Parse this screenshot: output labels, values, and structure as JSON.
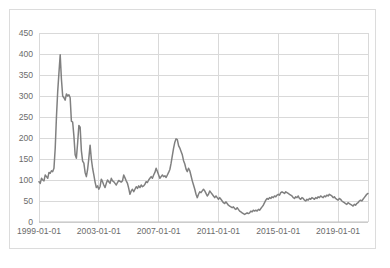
{
  "chart_data": {
    "type": "line",
    "title": "",
    "subtitle": "",
    "xlabel": "",
    "ylabel": "",
    "grid": true,
    "legend": false,
    "legend_position": "none",
    "line_color": "#808080",
    "line_width": 1.5,
    "plot_background": "#ffffff",
    "gridline_color": "#d9d9d9",
    "axis_color": "#bfbfbf",
    "tick_label_color": "#6b6b6b",
    "ylim": [
      0,
      450
    ],
    "yticks": [
      0,
      50,
      100,
      150,
      200,
      250,
      300,
      350,
      400,
      450
    ],
    "ytick_labels": [
      "0",
      "50",
      "100",
      "150",
      "200",
      "250",
      "300",
      "350",
      "400",
      "450"
    ],
    "xlim": [
      "1999-01-01",
      "2021-01-01"
    ],
    "xticks": [
      "1999-01-01",
      "2003-01-01",
      "2007-01-01",
      "2011-01-01",
      "2015-01-01",
      "2019-01-01"
    ],
    "xtick_labels": [
      "1999-01-01",
      "2003-01-01",
      "2007-01-01",
      "2011-01-01",
      "2015-01-01",
      "2019-01-01"
    ],
    "series": [
      {
        "name": "series-1",
        "color": "#808080",
        "x": [
          "1999-01-01",
          "1999-02-01",
          "1999-03-01",
          "1999-04-01",
          "1999-05-01",
          "1999-06-01",
          "1999-07-01",
          "1999-08-01",
          "1999-09-01",
          "1999-10-01",
          "1999-11-01",
          "1999-12-01",
          "2000-01-01",
          "2000-02-01",
          "2000-03-01",
          "2000-04-01",
          "2000-05-01",
          "2000-06-01",
          "2000-07-01",
          "2000-08-01",
          "2000-09-01",
          "2000-10-01",
          "2000-11-01",
          "2000-12-01",
          "2001-01-01",
          "2001-02-01",
          "2001-03-01",
          "2001-04-01",
          "2001-05-01",
          "2001-06-01",
          "2001-07-01",
          "2001-08-01",
          "2001-09-01",
          "2001-10-01",
          "2001-11-01",
          "2001-12-01",
          "2002-01-01",
          "2002-02-01",
          "2002-03-01",
          "2002-04-01",
          "2002-05-01",
          "2002-06-01",
          "2002-07-01",
          "2002-08-01",
          "2002-09-01",
          "2002-10-01",
          "2002-11-01",
          "2002-12-01",
          "2003-01-01",
          "2003-02-01",
          "2003-03-01",
          "2003-04-01",
          "2003-05-01",
          "2003-06-01",
          "2003-07-01",
          "2003-08-01",
          "2003-09-01",
          "2003-10-01",
          "2003-11-01",
          "2003-12-01",
          "2004-01-01",
          "2004-02-01",
          "2004-03-01",
          "2004-04-01",
          "2004-05-01",
          "2004-06-01",
          "2004-07-01",
          "2004-08-01",
          "2004-09-01",
          "2004-10-01",
          "2004-11-01",
          "2004-12-01",
          "2005-01-01",
          "2005-02-01",
          "2005-03-01",
          "2005-04-01",
          "2005-05-01",
          "2005-06-01",
          "2005-07-01",
          "2005-08-01",
          "2005-09-01",
          "2005-10-01",
          "2005-11-01",
          "2005-12-01",
          "2006-01-01",
          "2006-02-01",
          "2006-03-01",
          "2006-04-01",
          "2006-05-01",
          "2006-06-01",
          "2006-07-01",
          "2006-08-01",
          "2006-09-01",
          "2006-10-01",
          "2006-11-01",
          "2006-12-01",
          "2007-01-01",
          "2007-02-01",
          "2007-03-01",
          "2007-04-01",
          "2007-05-01",
          "2007-06-01",
          "2007-07-01",
          "2007-08-01",
          "2007-09-01",
          "2007-10-01",
          "2007-11-01",
          "2007-12-01",
          "2008-01-01",
          "2008-02-01",
          "2008-03-01",
          "2008-04-01",
          "2008-05-01",
          "2008-06-01",
          "2008-07-01",
          "2008-08-01",
          "2008-09-01",
          "2008-10-01",
          "2008-11-01",
          "2008-12-01",
          "2009-01-01",
          "2009-02-01",
          "2009-03-01",
          "2009-04-01",
          "2009-05-01",
          "2009-06-01",
          "2009-07-01",
          "2009-08-01",
          "2009-09-01",
          "2009-10-01",
          "2009-11-01",
          "2009-12-01",
          "2010-01-01",
          "2010-02-01",
          "2010-03-01",
          "2010-04-01",
          "2010-05-01",
          "2010-06-01",
          "2010-07-01",
          "2010-08-01",
          "2010-09-01",
          "2010-10-01",
          "2010-11-01",
          "2010-12-01",
          "2011-01-01",
          "2011-02-01",
          "2011-03-01",
          "2011-04-01",
          "2011-05-01",
          "2011-06-01",
          "2011-07-01",
          "2011-08-01",
          "2011-09-01",
          "2011-10-01",
          "2011-11-01",
          "2011-12-01",
          "2012-01-01",
          "2012-02-01",
          "2012-03-01",
          "2012-04-01",
          "2012-05-01",
          "2012-06-01",
          "2012-07-01",
          "2012-08-01",
          "2012-09-01",
          "2012-10-01",
          "2012-11-01",
          "2012-12-01",
          "2013-01-01",
          "2013-02-01",
          "2013-03-01",
          "2013-04-01",
          "2013-05-01",
          "2013-06-01",
          "2013-07-01",
          "2013-08-01",
          "2013-09-01",
          "2013-10-01",
          "2013-11-01",
          "2013-12-01",
          "2014-01-01",
          "2014-02-01",
          "2014-03-01",
          "2014-04-01",
          "2014-05-01",
          "2014-06-01",
          "2014-07-01",
          "2014-08-01",
          "2014-09-01",
          "2014-10-01",
          "2014-11-01",
          "2014-12-01",
          "2015-01-01",
          "2015-02-01",
          "2015-03-01",
          "2015-04-01",
          "2015-05-01",
          "2015-06-01",
          "2015-07-01",
          "2015-08-01",
          "2015-09-01",
          "2015-10-01",
          "2015-11-01",
          "2015-12-01",
          "2016-01-01",
          "2016-02-01",
          "2016-03-01",
          "2016-04-01",
          "2016-05-01",
          "2016-06-01",
          "2016-07-01",
          "2016-08-01",
          "2016-09-01",
          "2016-10-01",
          "2016-11-01",
          "2016-12-01",
          "2017-01-01",
          "2017-02-01",
          "2017-03-01",
          "2017-04-01",
          "2017-05-01",
          "2017-06-01",
          "2017-07-01",
          "2017-08-01",
          "2017-09-01",
          "2017-10-01",
          "2017-11-01",
          "2017-12-01",
          "2018-01-01",
          "2018-02-01",
          "2018-03-01",
          "2018-04-01",
          "2018-05-01",
          "2018-06-01",
          "2018-07-01",
          "2018-08-01",
          "2018-09-01",
          "2018-10-01",
          "2018-11-01",
          "2018-12-01",
          "2019-01-01",
          "2019-02-01",
          "2019-03-01",
          "2019-04-01",
          "2019-05-01",
          "2019-06-01",
          "2019-07-01",
          "2019-08-01",
          "2019-09-01",
          "2019-10-01",
          "2019-11-01",
          "2019-12-01",
          "2020-01-01",
          "2020-02-01",
          "2020-03-01",
          "2020-04-01",
          "2020-05-01",
          "2020-06-01",
          "2020-07-01",
          "2020-08-01",
          "2020-09-01",
          "2020-10-01",
          "2020-11-01",
          "2020-12-01",
          "2021-01-01"
        ],
        "values": [
          96,
          92,
          104,
          100,
          98,
          112,
          108,
          104,
          118,
          116,
          122,
          120,
          128,
          175,
          250,
          310,
          355,
          398,
          340,
          300,
          296,
          290,
          305,
          300,
          303,
          296,
          240,
          238,
          205,
          160,
          152,
          188,
          230,
          226,
          170,
          145,
          140,
          118,
          108,
          125,
          152,
          183,
          150,
          128,
          112,
          95,
          82,
          86,
          78,
          84,
          102,
          96,
          88,
          82,
          92,
          100,
          96,
          92,
          104,
          98,
          96,
          92,
          88,
          94,
          99,
          97,
          95,
          98,
          112,
          105,
          98,
          92,
          80,
          66,
          74,
          78,
          72,
          78,
          84,
          80,
          86,
          82,
          88,
          84,
          86,
          90,
          96,
          94,
          100,
          104,
          108,
          104,
          112,
          118,
          128,
          120,
          112,
          104,
          108,
          112,
          108,
          110,
          106,
          112,
          118,
          125,
          140,
          158,
          176,
          190,
          198,
          196,
          182,
          176,
          168,
          160,
          146,
          138,
          126,
          120,
          128,
          122,
          110,
          98,
          88,
          78,
          66,
          58,
          66,
          72,
          70,
          74,
          78,
          74,
          68,
          62,
          66,
          74,
          70,
          66,
          62,
          58,
          62,
          58,
          54,
          58,
          54,
          50,
          46,
          44,
          48,
          44,
          40,
          38,
          36,
          34,
          36,
          32,
          30,
          34,
          30,
          26,
          24,
          22,
          20,
          18,
          20,
          22,
          20,
          22,
          26,
          24,
          28,
          26,
          28,
          26,
          30,
          28,
          32,
          36,
          40,
          46,
          52,
          56,
          54,
          58,
          56,
          60,
          58,
          62,
          60,
          64,
          66,
          64,
          70,
          72,
          70,
          68,
          72,
          70,
          68,
          66,
          64,
          62,
          58,
          56,
          60,
          58,
          62,
          56,
          54,
          58,
          56,
          52,
          50,
          54,
          52,
          56,
          54,
          58,
          56,
          54,
          58,
          56,
          60,
          58,
          62,
          60,
          58,
          62,
          60,
          64,
          62,
          66,
          64,
          62,
          58,
          60,
          56,
          54,
          52,
          56,
          54,
          50,
          48,
          46,
          44,
          42,
          46,
          44,
          42,
          40,
          38,
          42,
          40,
          44,
          46,
          50,
          52,
          50,
          54,
          58,
          62,
          66,
          68
        ]
      }
    ]
  }
}
